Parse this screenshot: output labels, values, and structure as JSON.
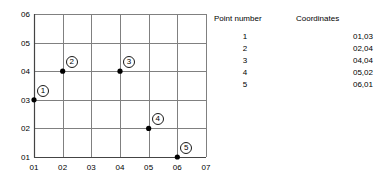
{
  "chart_data": {
    "type": "scatter",
    "title": "",
    "xlabel": "",
    "ylabel": "",
    "xlim": [
      1,
      7
    ],
    "ylim": [
      1,
      6
    ],
    "grid": true,
    "legend": "none",
    "x_tick_labels": [
      "01",
      "02",
      "03",
      "04",
      "05",
      "06",
      "07"
    ],
    "y_tick_labels": [
      "01",
      "02",
      "03",
      "04",
      "05",
      "06"
    ],
    "x_ticks": [
      1,
      2,
      3,
      4,
      5,
      6,
      7
    ],
    "y_ticks": [
      1,
      2,
      3,
      4,
      5,
      6
    ],
    "points": [
      {
        "label": "1",
        "x": 1,
        "y": 3,
        "coordinates": "01,03"
      },
      {
        "label": "2",
        "x": 2,
        "y": 4,
        "coordinates": "02,04"
      },
      {
        "label": "3",
        "x": 4,
        "y": 4,
        "coordinates": "04,04"
      },
      {
        "label": "4",
        "x": 5,
        "y": 2,
        "coordinates": "05,02"
      },
      {
        "label": "5",
        "x": 6,
        "y": 1,
        "coordinates": "06,01"
      }
    ]
  },
  "table": {
    "headers": {
      "point_number": "Point number",
      "coordinates": "Coordinates"
    },
    "rows": [
      {
        "number": "1",
        "coordinates": "01,03"
      },
      {
        "number": "2",
        "coordinates": "02,04"
      },
      {
        "number": "3",
        "coordinates": "04,04"
      },
      {
        "number": "4",
        "coordinates": "05,02"
      },
      {
        "number": "5",
        "coordinates": "06,01"
      }
    ]
  },
  "colors": {
    "background": "#ffffff",
    "grid": "#808080",
    "axis": "#555555",
    "marker": "#000000",
    "text": "#000000"
  }
}
